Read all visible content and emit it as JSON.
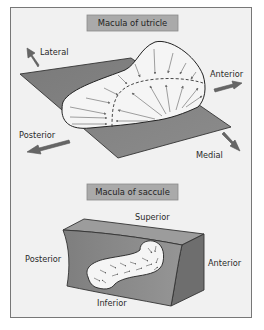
{
  "figure": {
    "utricle": {
      "title": "Macula of utricle",
      "labels": {
        "lateral": "Lateral",
        "anterior": "Anterior",
        "posterior": "Posterior",
        "medial": "Medial"
      }
    },
    "saccule": {
      "title": "Macula of saccule",
      "labels": {
        "superior": "Superior",
        "posterior": "Posterior",
        "anterior": "Anterior",
        "inferior": "Inferior"
      }
    }
  },
  "colors": {
    "frame_bg": "#f2f2f2",
    "frame_border": "#7a7a7a",
    "title_box": "#a9a9a9",
    "plane_fill": "#7d7d7d",
    "macula_fill": "#f4f4f4",
    "arrow": "#707070",
    "block_front": "#8a8a8a",
    "block_top": "#9a9a9a",
    "block_side": "#6c6c6c"
  }
}
